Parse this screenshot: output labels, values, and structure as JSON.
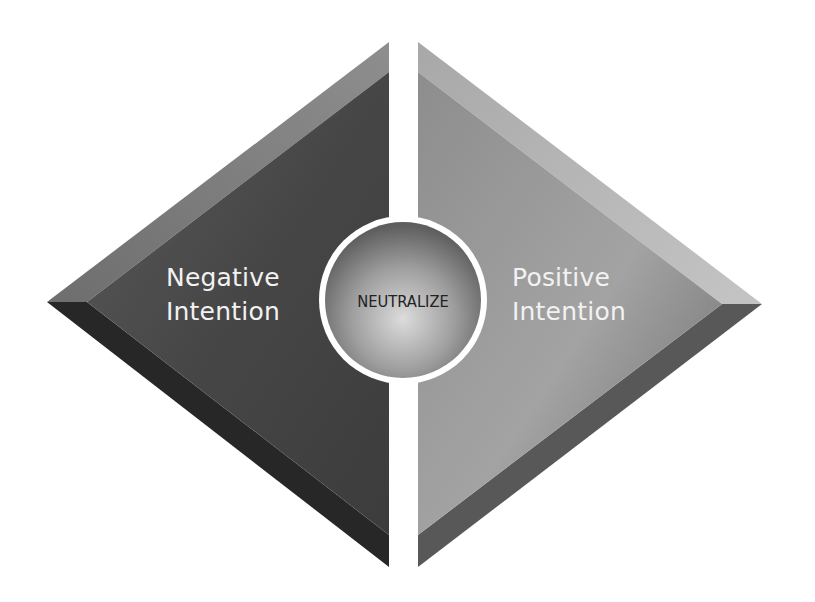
{
  "diagram": {
    "left_panel": {
      "line1": "Negative",
      "line2": "Intention"
    },
    "right_panel": {
      "line1": "Positive",
      "line2": "Intention"
    },
    "center": {
      "label": "NEUTRALIZE"
    },
    "colors": {
      "left_face": "#474747",
      "left_top_bevel": "#7c7c7c",
      "left_bottom_bevel": "#262626",
      "right_face": "#9a9a9a",
      "right_top_bevel": "#b5b5b5",
      "right_bottom_bevel": "#575757",
      "divider": "#ffffff",
      "text_light": "#f2f2f2",
      "text_dark": "#222222"
    }
  }
}
